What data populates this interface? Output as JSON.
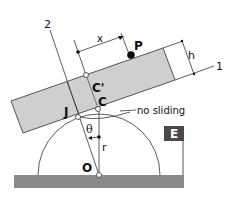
{
  "diagram": {
    "type": "physics-statics",
    "labels": {
      "axis_2": "2",
      "axis_1": "1",
      "dim_x": "x",
      "dim_h": "h",
      "point_P": "P",
      "point_C_prime": "C'",
      "point_C": "C",
      "point_J": "J",
      "point_O": "O",
      "angle": "θ",
      "radius": "r",
      "note": "no sliding",
      "badge": "E"
    },
    "colors": {
      "block_fill": "#cfcfcf",
      "block_stroke": "#555555",
      "ground_fill": "#8a8a8a",
      "badge_fill": "#4a4a4a",
      "badge_text": "#ffffff",
      "line": "#333333"
    }
  }
}
